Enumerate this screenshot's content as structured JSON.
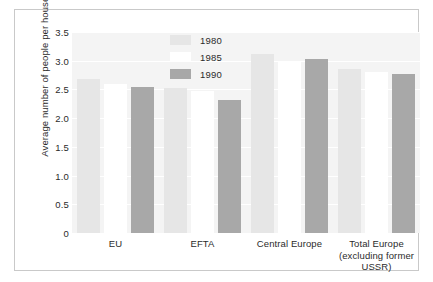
{
  "chart_data": {
    "type": "bar",
    "title": "",
    "xlabel": "",
    "ylabel": "Average number of people per household",
    "categories": [
      "EU",
      "EFTA",
      "Central Europe",
      "Total Europe (excluding former USSR)"
    ],
    "category_lines": [
      [
        "EU"
      ],
      [
        "EFTA"
      ],
      [
        "Central Europe"
      ],
      [
        "Total Europe",
        "(excluding former",
        "USSR)"
      ]
    ],
    "series": [
      {
        "name": "1980",
        "color": "#e6e6e6",
        "values": [
          2.68,
          2.52,
          3.11,
          2.85
        ]
      },
      {
        "name": "1985",
        "color": "#ffffff",
        "values": [
          2.6,
          2.48,
          2.98,
          2.8
        ]
      },
      {
        "name": "1990",
        "color": "#a8a8a8",
        "values": [
          2.55,
          2.31,
          3.03,
          2.77
        ]
      }
    ],
    "ylim": [
      0,
      3.5
    ],
    "yticks": [
      0,
      0.5,
      1.0,
      1.5,
      2.0,
      2.5,
      3.0,
      3.5
    ],
    "ytick_labels": [
      "0",
      "0.5",
      "1.0",
      "1.5",
      "2.0",
      "2.5",
      "3.0",
      "3.5"
    ],
    "grid": true,
    "legend_position": "top-center",
    "plot_background": "#f4f4f4",
    "gridline_color": "#ffffff",
    "frame_color": "#c9c9c9"
  }
}
